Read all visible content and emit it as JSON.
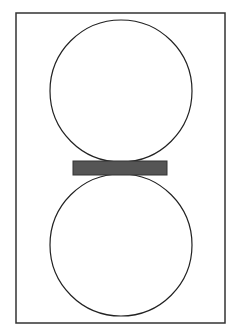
{
  "diagram": {
    "frame": {
      "x": 16,
      "y": 13,
      "width": 209,
      "height": 310,
      "stroke": "#333333"
    },
    "circles": [
      {
        "name": "top-circle",
        "cx": 121,
        "cy": 91,
        "r": 71,
        "stroke": "#222222"
      },
      {
        "name": "bottom-circle",
        "cx": 121,
        "cy": 245,
        "r": 71,
        "stroke": "#222222"
      }
    ],
    "bar": {
      "x": 73,
      "y": 161,
      "width": 94,
      "height": 14,
      "fill": "#555555",
      "stroke": "#333333"
    }
  }
}
